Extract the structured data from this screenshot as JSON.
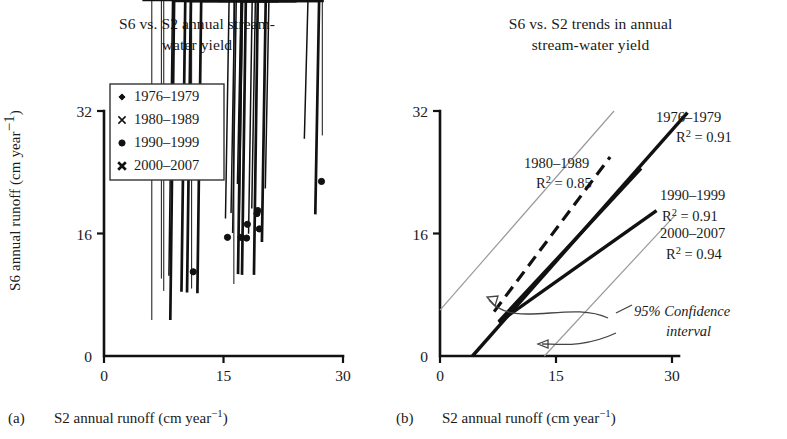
{
  "figure": {
    "y_axis_label": "S6 annual runoff (cm year",
    "y_axis_label_sup": "−1",
    "y_axis_label_tail": ")",
    "x_axis_label": "S2 annual runoff (cm year",
    "x_axis_label_sup": "−1",
    "x_axis_label_tail": ")",
    "panel_a_tag": "(a)",
    "panel_b_tag": "(b)",
    "ink_color": "#111111",
    "ci_color": "#9a9a9a"
  },
  "panel_a": {
    "title_line1": "S6 vs. S2 annual stream-",
    "title_line2": "water yield",
    "legend": [
      {
        "label": "1976–1979",
        "marker": "small-diamond"
      },
      {
        "label": "1980–1989",
        "marker": "thin-cross"
      },
      {
        "label": "1990–1999",
        "marker": "filled-circle"
      },
      {
        "label": "2000–2007",
        "marker": "bold-cross"
      }
    ]
  },
  "panel_b": {
    "title_line1": "S6 vs. S2 trends in annual",
    "title_line2": "stream-water yield",
    "annotations": [
      {
        "name": "1976-1979",
        "period": "1976–1979",
        "r2": "R",
        "r2_sup": "2",
        "r2_val": " = 0.91"
      },
      {
        "name": "1980-1989",
        "period": "1980–1989",
        "r2": "R",
        "r2_sup": "2",
        "r2_val": " = 0.85"
      },
      {
        "name": "1990-1999",
        "period": "1990–1999",
        "r2": "R",
        "r2_sup": "2",
        "r2_val": " = 0.91"
      },
      {
        "name": "2000-2007",
        "period": "2000–2007",
        "r2": "R",
        "r2_sup": "2",
        "r2_val": " = 0.94"
      }
    ],
    "ci_label_line1": "95% Confidence",
    "ci_label_line2": "interval"
  },
  "chart_data": [
    {
      "type": "scatter",
      "panel": "a",
      "title": "S6 vs. S2 annual stream-water yield",
      "xlabel": "S2 annual runoff (cm year−1)",
      "ylabel": "S6 annual runoff (cm year−1)",
      "xlim": [
        0,
        30
      ],
      "ylim": [
        0,
        32
      ],
      "xticks": [
        0,
        15,
        30
      ],
      "yticks": [
        0,
        16,
        32
      ],
      "grid": false,
      "legend_position": "upper-left",
      "series": [
        {
          "name": "1976–1979",
          "marker": "small-diamond",
          "points": [
            [
              6.0,
              4.3
            ],
            [
              7.2,
              9.7
            ],
            [
              7.5,
              8.1
            ],
            [
              11.0,
              8.4
            ],
            [
              16.3,
              9.0
            ],
            [
              27.4,
              28.4
            ]
          ]
        },
        {
          "name": "1980–1989",
          "marker": "thin-cross",
          "points": [
            [
              8.6,
              10.0
            ],
            [
              15.7,
              17.5
            ],
            [
              16.4,
              18.2
            ],
            [
              16.6,
              15.6
            ],
            [
              17.2,
              22.0
            ],
            [
              17.4,
              16.2
            ],
            [
              18.6,
              15.5
            ],
            [
              19.0,
              18.8
            ],
            [
              20.7,
              21.4
            ],
            [
              25.6,
              27.9
            ]
          ]
        },
        {
          "name": "1990–1999",
          "marker": "filled-circle",
          "points": [
            [
              11.2,
              11.0
            ],
            [
              15.5,
              15.5
            ],
            [
              17.2,
              15.5
            ],
            [
              17.9,
              15.4
            ],
            [
              18.0,
              17.2
            ],
            [
              19.2,
              18.6
            ],
            [
              19.3,
              19.0
            ],
            [
              19.5,
              16.6
            ],
            [
              27.3,
              22.8
            ]
          ]
        },
        {
          "name": "2000–2007",
          "marker": "bold-cross",
          "points": [
            [
              8.8,
              4.2
            ],
            [
              10.2,
              7.9
            ],
            [
              10.9,
              7.8
            ],
            [
              12.2,
              7.7
            ],
            [
              17.3,
              10.2
            ],
            [
              17.8,
              10.1
            ],
            [
              19.3,
              10.1
            ],
            [
              20.3,
              14.4
            ],
            [
              27.0,
              18.0
            ]
          ]
        }
      ]
    },
    {
      "type": "line",
      "panel": "b",
      "title": "S6 vs. S2 trends in annual stream-water yield",
      "xlabel": "S2 annual runoff (cm year−1)",
      "ylabel": "S6 annual runoff (cm year−1)",
      "xlim": [
        0,
        30
      ],
      "ylim": [
        0,
        32
      ],
      "xticks": [
        0,
        15,
        30
      ],
      "yticks": [
        0,
        16,
        32
      ],
      "grid": false,
      "series": [
        {
          "name": "1976–1979",
          "r2": 0.91,
          "style": "solid-thick",
          "x": [
            4.2,
            32.0
          ],
          "y": [
            0.0,
            31.8
          ]
        },
        {
          "name": "1980–1989",
          "r2": 0.85,
          "style": "dashed",
          "x": [
            7.0,
            22.0
          ],
          "y": [
            5.8,
            26.0
          ]
        },
        {
          "name": "1990–1999",
          "r2": 0.91,
          "style": "solid-thick",
          "x": [
            7.6,
            26.0
          ],
          "y": [
            4.5,
            24.5
          ]
        },
        {
          "name": "2000–2007",
          "r2": 0.94,
          "style": "solid-thick",
          "x": [
            7.6,
            28.0
          ],
          "y": [
            4.4,
            19.0
          ]
        }
      ],
      "confidence_bands": [
        {
          "name": "upper-95-bound",
          "x": [
            0.0,
            22.5
          ],
          "y": [
            6.0,
            32.0
          ]
        },
        {
          "name": "lower-95-bound",
          "x": [
            13.5,
            30.5
          ],
          "y": [
            0.0,
            18.5
          ]
        }
      ],
      "annotations": [
        "1976–1979 R2 = 0.91",
        "1980–1989 R2 = 0.85",
        "1990–1999 R2 = 0.91",
        "2000–2007 R2 = 0.94",
        "95% Confidence interval"
      ]
    }
  ]
}
